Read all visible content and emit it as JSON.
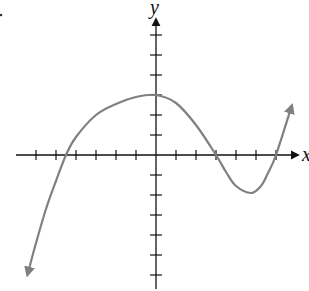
{
  "chart_data": {
    "type": "line",
    "title": "",
    "xlabel": "x",
    "ylabel": "y",
    "grid": false,
    "legend": null,
    "xlim": [
      -7,
      7
    ],
    "ylim": [
      -7,
      7
    ],
    "x_ticks": [
      -6,
      -5,
      -4,
      -3,
      -2,
      -1,
      1,
      2,
      3,
      4,
      5,
      6
    ],
    "y_ticks": [
      -6,
      -5,
      -4,
      -3,
      -2,
      -1,
      1,
      2,
      3,
      4,
      5,
      6
    ],
    "tick_labels_shown": false,
    "series": [
      {
        "name": "f(x)",
        "color": "#808080",
        "arrows_at_ends": true,
        "x": [
          -6.35,
          -6.0,
          -5.5,
          -5.0,
          -4.5,
          -4.0,
          -3.0,
          -2.0,
          -1.0,
          0.0,
          1.0,
          2.0,
          3.0,
          3.5,
          4.0,
          4.75,
          5.25,
          5.6,
          6.0,
          6.8
        ],
        "y": [
          -5.7,
          -4.4,
          -2.7,
          -1.3,
          0.0,
          0.9,
          2.0,
          2.55,
          2.9,
          3.0,
          2.6,
          1.5,
          0.0,
          -0.85,
          -1.55,
          -1.9,
          -1.55,
          -0.9,
          0.0,
          2.5
        ]
      }
    ],
    "features": {
      "y_intercept": 3,
      "x_intercepts": [
        -4.5,
        3,
        6
      ],
      "local_max": [
        0,
        3
      ],
      "local_min": [
        4.75,
        -1.9
      ]
    }
  },
  "labels": {
    "x_axis": "x",
    "y_axis": "y"
  },
  "colors": {
    "axis": "#111111",
    "curve": "#808080"
  }
}
